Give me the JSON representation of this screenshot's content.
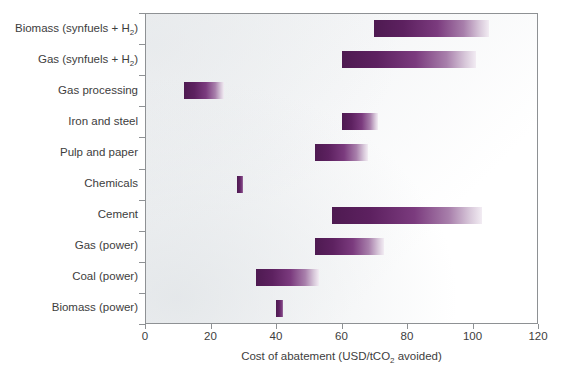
{
  "chart_data": {
    "type": "bar",
    "orientation": "horizontal",
    "title": "",
    "xlabel": "Cost of abatement (USD/tCO2 avoided)",
    "xlabel_parts": {
      "pre": "Cost of abatement (USD/tCO",
      "sub": "2",
      "post": " avoided)"
    },
    "ylabel": "",
    "xlim": [
      0,
      120
    ],
    "xticks": [
      0,
      20,
      40,
      60,
      80,
      100,
      120
    ],
    "xticklabels": [
      "0",
      "20",
      "40",
      "60",
      "80",
      "100",
      "120"
    ],
    "grid": false,
    "legend": false,
    "bar_color_dark": "#4e1a51",
    "bar_color_light": "#f2ecf3",
    "axis_color": "#8e9194",
    "plot_background": "#f4f5f6",
    "categories": [
      "Biomass (synfuels + H2)",
      "Gas (synfuels + H2)",
      "Gas processing",
      "Iron and steel",
      "Pulp and paper",
      "Chemicals",
      "Cement",
      "Gas (power)",
      "Coal (power)",
      "Biomass (power)"
    ],
    "ranges": [
      {
        "label": "Biomass (synfuels + H2)",
        "label_pre": "Biomass (synfuels + H",
        "label_sub": "2",
        "label_post": ")",
        "low": 70,
        "high": 105
      },
      {
        "label": "Gas (synfuels + H2)",
        "label_pre": "Gas (synfuels + H",
        "label_sub": "2",
        "label_post": ")",
        "low": 60,
        "high": 101
      },
      {
        "label": "Gas processing",
        "label_pre": "Gas processing",
        "label_sub": "",
        "label_post": "",
        "low": 12,
        "high": 24
      },
      {
        "label": "Iron and steel",
        "label_pre": "Iron and steel",
        "label_sub": "",
        "label_post": "",
        "low": 60,
        "high": 71
      },
      {
        "label": "Pulp and paper",
        "label_pre": "Pulp and paper",
        "label_sub": "",
        "label_post": "",
        "low": 52,
        "high": 68
      },
      {
        "label": "Chemicals",
        "label_pre": "Chemicals",
        "label_sub": "",
        "label_post": "",
        "low": 28,
        "high": 30
      },
      {
        "label": "Cement",
        "label_pre": "Cement",
        "label_sub": "",
        "label_post": "",
        "low": 57,
        "high": 103
      },
      {
        "label": "Gas (power)",
        "label_pre": "Gas (power)",
        "label_sub": "",
        "label_post": "",
        "low": 52,
        "high": 73
      },
      {
        "label": "Coal (power)",
        "label_pre": "Coal (power)",
        "label_sub": "",
        "label_post": "",
        "low": 34,
        "high": 53
      },
      {
        "label": "Biomass (power)",
        "label_pre": "Biomass (power)",
        "label_sub": "",
        "label_post": "",
        "low": 40,
        "high": 42
      }
    ]
  }
}
